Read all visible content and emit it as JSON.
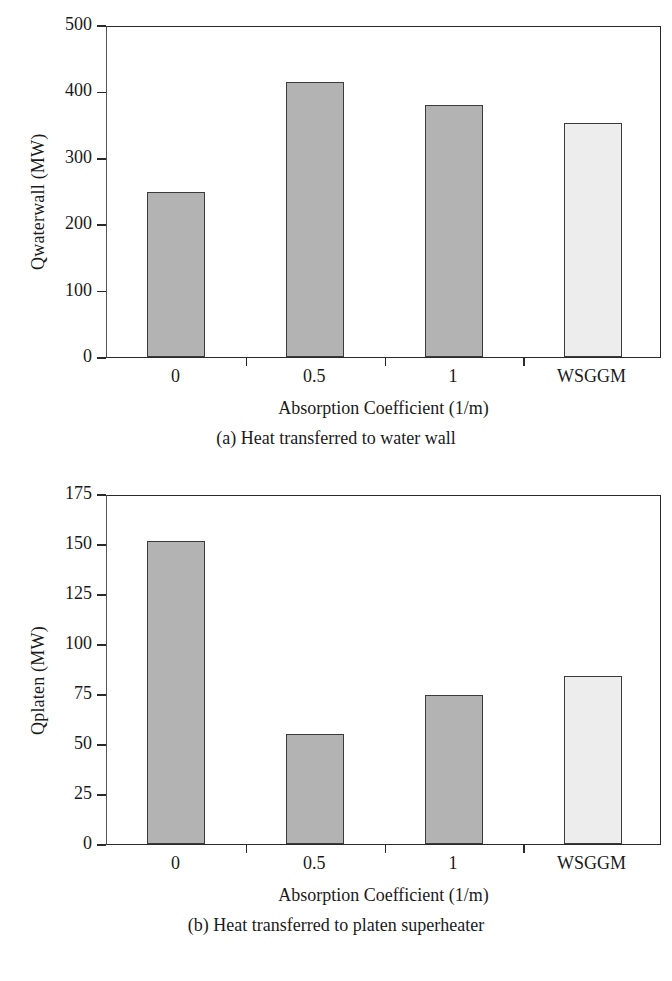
{
  "figure": {
    "panels": [
      {
        "id": "panel-a",
        "caption": "(a) Heat transferred to water wall",
        "chart": {
          "type": "bar",
          "title": "",
          "xlabel": "Absorption Coefficient (1/m)",
          "ylabel": "Qwaterwall (MW)",
          "categories": [
            "0",
            "0.5",
            "1",
            "WSGGM"
          ],
          "values": [
            249,
            414,
            380,
            353
          ],
          "ylim": [
            0,
            500
          ],
          "yticks": [
            0,
            100,
            200,
            300,
            400,
            500
          ],
          "ytick_labels": [
            "0",
            "100",
            "200",
            "300",
            "400",
            "500"
          ],
          "grid": false,
          "legend": "none",
          "bar_colors": [
            "#b3b3b3",
            "#b3b3b3",
            "#b3b3b3",
            "#ededed"
          ],
          "bar_edge_color": "#3b3b3b"
        }
      },
      {
        "id": "panel-b",
        "caption": "(b) Heat transferred to platen superheater",
        "chart": {
          "type": "bar",
          "title": "",
          "xlabel": "Absorption Coefficient (1/m)",
          "ylabel": "Qplaten (MW)",
          "categories": [
            "0",
            "0.5",
            "1",
            "WSGGM"
          ],
          "values": [
            151.5,
            55,
            74.5,
            84
          ],
          "ylim": [
            0,
            175
          ],
          "yticks": [
            0,
            25,
            50,
            75,
            100,
            125,
            150,
            175
          ],
          "ytick_labels": [
            "0",
            "25",
            "50",
            "75",
            "100",
            "125",
            "150",
            "175"
          ],
          "grid": false,
          "legend": "none",
          "bar_colors": [
            "#b3b3b3",
            "#b3b3b3",
            "#b3b3b3",
            "#ededed"
          ],
          "bar_edge_color": "#3b3b3b"
        }
      }
    ]
  },
  "chart_data": [
    {
      "type": "bar",
      "title": "(a) Heat transferred to water wall",
      "categories": [
        "0",
        "0.5",
        "1",
        "WSGGM"
      ],
      "values": [
        249,
        414,
        380,
        353
      ],
      "xlabel": "Absorption Coefficient (1/m)",
      "ylabel": "Qwaterwall (MW)",
      "ylim": [
        0,
        500
      ],
      "yticks": [
        0,
        100,
        200,
        300,
        400,
        500
      ],
      "grid": false,
      "legend": "none"
    },
    {
      "type": "bar",
      "title": "(b) Heat transferred to platen superheater",
      "categories": [
        "0",
        "0.5",
        "1",
        "WSGGM"
      ],
      "values": [
        151.5,
        55,
        74.5,
        84
      ],
      "xlabel": "Absorption Coefficient (1/m)",
      "ylabel": "Qplaten (MW)",
      "ylim": [
        0,
        175
      ],
      "yticks": [
        0,
        25,
        50,
        75,
        100,
        125,
        150,
        175
      ],
      "grid": false,
      "legend": "none"
    }
  ]
}
